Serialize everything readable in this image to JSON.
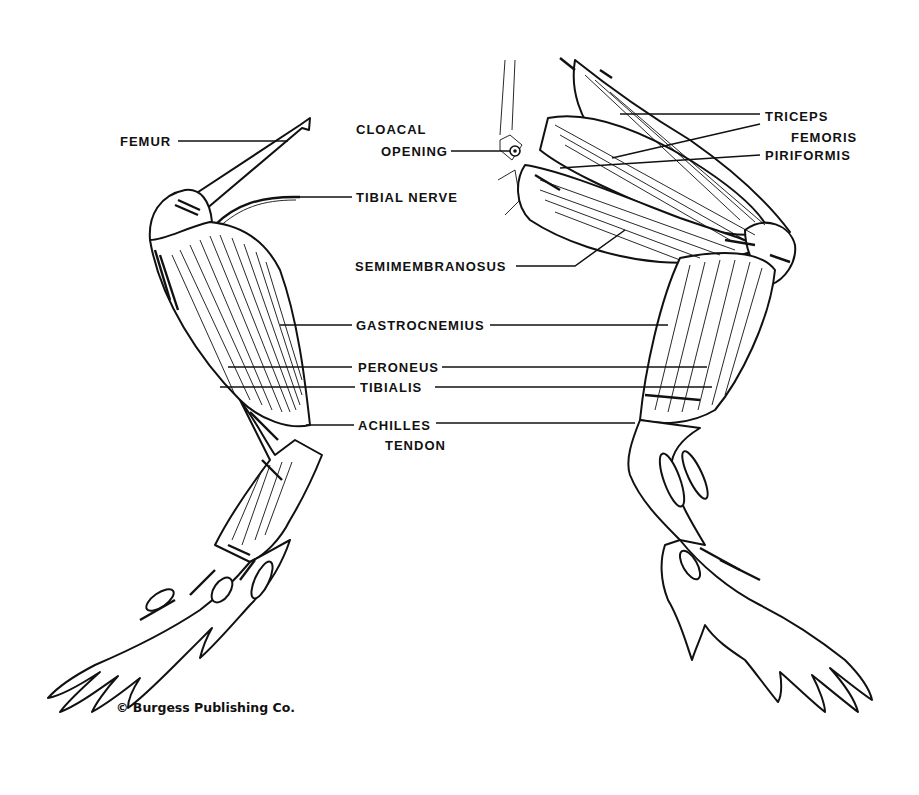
{
  "diagram": {
    "credit": "© Burgess Publishing Co.",
    "labels": [
      {
        "id": "femur",
        "text": "FEMUR",
        "x": 120,
        "y": 134
      },
      {
        "id": "cloacal-opening-1",
        "text": "CLOACAL",
        "x": 356,
        "y": 122
      },
      {
        "id": "cloacal-opening-2",
        "text": "OPENING",
        "x": 381,
        "y": 144
      },
      {
        "id": "tibial-nerve",
        "text": "TIBIAL NERVE",
        "x": 356,
        "y": 190
      },
      {
        "id": "triceps-1",
        "text": "TRICEPS",
        "x": 765,
        "y": 109
      },
      {
        "id": "triceps-2",
        "text": "FEMORIS",
        "x": 791,
        "y": 130
      },
      {
        "id": "piriformis",
        "text": "PIRIFORMIS",
        "x": 765,
        "y": 148
      },
      {
        "id": "semimembranosus",
        "text": "SEMIMEMBRANOSUS",
        "x": 355,
        "y": 259
      },
      {
        "id": "gastrocnemius",
        "text": "GASTROCNEMIUS",
        "x": 356,
        "y": 318
      },
      {
        "id": "peroneus",
        "text": "PERONEUS",
        "x": 358,
        "y": 360
      },
      {
        "id": "tibialis",
        "text": "TIBIALIS",
        "x": 360,
        "y": 380
      },
      {
        "id": "achilles-1",
        "text": "ACHILLES",
        "x": 358,
        "y": 418
      },
      {
        "id": "achilles-2",
        "text": "TENDON",
        "x": 385,
        "y": 438
      }
    ],
    "leaders": [
      {
        "for": "femur",
        "points": [
          [
            178,
            141
          ],
          [
            288,
            141
          ]
        ]
      },
      {
        "for": "cloacal-opening",
        "points": [
          [
            451,
            151
          ],
          [
            510,
            151
          ]
        ]
      },
      {
        "for": "tibial-nerve",
        "points": [
          [
            298,
            197
          ],
          [
            352,
            197
          ]
        ]
      },
      {
        "for": "triceps",
        "points": [
          [
            620,
            114
          ],
          [
            760,
            114
          ]
        ]
      },
      {
        "for": "femoris",
        "points": [
          [
            760,
            124
          ],
          [
            612,
            158
          ]
        ]
      },
      {
        "for": "piriformis",
        "points": [
          [
            760,
            155
          ],
          [
            560,
            168
          ]
        ]
      },
      {
        "for": "semimembranosus",
        "points": [
          [
            516,
            266
          ],
          [
            575,
            266
          ],
          [
            625,
            230
          ]
        ]
      },
      {
        "for": "gastrocnemius-left",
        "points": [
          [
            280,
            325
          ],
          [
            352,
            325
          ]
        ]
      },
      {
        "for": "gastrocnemius-right",
        "points": [
          [
            490,
            325
          ],
          [
            668,
            325
          ]
        ]
      },
      {
        "for": "peroneus-left",
        "points": [
          [
            228,
            367
          ],
          [
            352,
            367
          ]
        ]
      },
      {
        "for": "peroneus-right",
        "points": [
          [
            442,
            367
          ],
          [
            707,
            367
          ]
        ]
      },
      {
        "for": "tibialis-left",
        "points": [
          [
            220,
            387
          ],
          [
            355,
            387
          ]
        ]
      },
      {
        "for": "tibialis-right",
        "points": [
          [
            435,
            387
          ],
          [
            712,
            387
          ]
        ]
      },
      {
        "for": "achilles-left",
        "points": [
          [
            306,
            425
          ],
          [
            354,
            425
          ]
        ]
      },
      {
        "for": "achilles-right",
        "points": [
          [
            436,
            423
          ],
          [
            635,
            423
          ]
        ]
      }
    ]
  }
}
